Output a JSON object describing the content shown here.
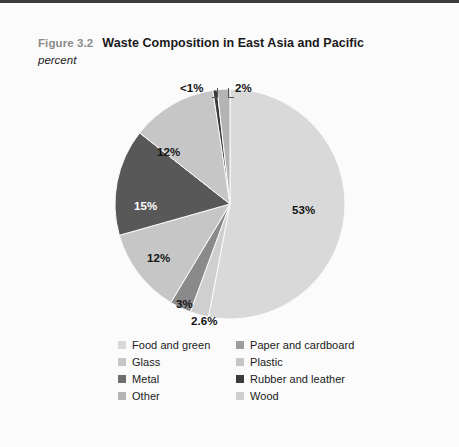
{
  "figure": {
    "number": "Figure 3.2",
    "title": "Waste Composition in East Asia and Pacific",
    "units": "percent"
  },
  "chart_data": {
    "type": "pie",
    "title": "Waste Composition in East Asia and Pacific",
    "subtitle": "",
    "xlabel": "",
    "ylabel": "percent",
    "units": "percent",
    "legend_position": "bottom",
    "grid": false,
    "categories": [
      "Food and green",
      "Wood",
      "Rubber and leather",
      "Glass",
      "Metal",
      "Plastic",
      "Other",
      "Paper and cardboard"
    ],
    "values": [
      53,
      2.6,
      3,
      12,
      15,
      12,
      0.5,
      2
    ],
    "slices": [
      {
        "label": "53%",
        "value": 53,
        "category": "Food and green",
        "color": "#d9d9d9",
        "start_deg": 0,
        "sweep_deg": 190.8
      },
      {
        "label": "2.6%",
        "value": 2.6,
        "category": "Wood",
        "color": "#cfcfcf",
        "start_deg": 190.8,
        "sweep_deg": 9.36
      },
      {
        "label": "3%",
        "value": 3,
        "category": "Rubber and leather",
        "color": "#8a8a8a",
        "start_deg": 200.2,
        "sweep_deg": 10.8
      },
      {
        "label": "12%",
        "value": 12,
        "category": "Glass",
        "color": "#c6c6c6",
        "start_deg": 211.0,
        "sweep_deg": 43.2
      },
      {
        "label": "15%",
        "value": 15,
        "category": "Metal",
        "color": "#585858",
        "start_deg": 254.2,
        "sweep_deg": 54.0
      },
      {
        "label": "12%",
        "value": 12,
        "category": "Plastic",
        "color": "#c6c6c6",
        "start_deg": 308.2,
        "sweep_deg": 43.2
      },
      {
        "label": "<1%",
        "value": 0.5,
        "category": "Other",
        "color": "#3a3a3a",
        "start_deg": 351.4,
        "sweep_deg": 2.2
      },
      {
        "label": "2%",
        "value": 2,
        "category": "Paper and cardboard",
        "color": "#b4b4b4",
        "start_deg": 353.6,
        "sweep_deg": 6.4
      }
    ]
  },
  "labels": {
    "l53": "53%",
    "l26": "2.6%",
    "l3": "3%",
    "l12a": "12%",
    "l15": "15%",
    "l12b": "12%",
    "lunder1": "<1%",
    "l2": "2%"
  },
  "legend": {
    "items": [
      {
        "label": "Food and green",
        "color": "#d9d9d9"
      },
      {
        "label": "Paper and cardboard",
        "color": "#9c9c9c"
      },
      {
        "label": "Glass",
        "color": "#c6c6c6"
      },
      {
        "label": "Plastic",
        "color": "#c6c6c6"
      },
      {
        "label": "Metal",
        "color": "#6e6e6e"
      },
      {
        "label": "Rubber and leather",
        "color": "#3a3a3a"
      },
      {
        "label": "Other",
        "color": "#b4b4b4"
      },
      {
        "label": "Wood",
        "color": "#cfcfcf"
      }
    ]
  }
}
